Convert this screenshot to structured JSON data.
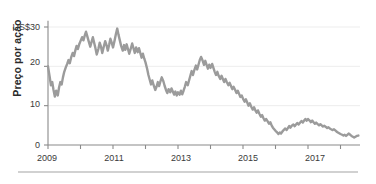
{
  "figure": {
    "partial_caption_above": "",
    "divider_color": "#999999",
    "background": "#ffffff"
  },
  "chart_data": {
    "type": "line",
    "title": "",
    "subtitle": "",
    "xlabel": "",
    "ylabel": "Preço por ação",
    "y_unit_prefix": "US$",
    "ylim": [
      0,
      33
    ],
    "xlim": [
      2009.0,
      2018.6
    ],
    "grid": "horizontal-faint",
    "legend": "none",
    "line_color": "#9b9b9b",
    "axis_color": "#8a8a8a",
    "gridline_color": "#ededed",
    "y_ticks": [
      {
        "value": 30,
        "label": "US$30"
      },
      {
        "value": 20,
        "label": "20"
      },
      {
        "value": 10,
        "label": "10"
      },
      {
        "value": 0,
        "label": "0"
      }
    ],
    "x_ticks_major": [
      {
        "value": 2009,
        "label": "2009"
      },
      {
        "value": 2011,
        "label": "2011"
      },
      {
        "value": 2013,
        "label": "2013"
      },
      {
        "value": 2015,
        "label": "2015"
      },
      {
        "value": 2017,
        "label": "2017"
      }
    ],
    "x_ticks_minor": [
      2010,
      2012,
      2014,
      2016,
      2018
    ],
    "series": [
      {
        "name": "Preço por ação",
        "color": "#9b9b9b",
        "x": [
          2009.0,
          2009.05,
          2009.09,
          2009.13,
          2009.17,
          2009.21,
          2009.25,
          2009.3,
          2009.34,
          2009.38,
          2009.42,
          2009.46,
          2009.5,
          2009.55,
          2009.59,
          2009.63,
          2009.67,
          2009.71,
          2009.76,
          2009.8,
          2009.84,
          2009.88,
          2009.92,
          2009.96,
          2010.0,
          2010.05,
          2010.09,
          2010.13,
          2010.17,
          2010.21,
          2010.25,
          2010.3,
          2010.34,
          2010.38,
          2010.42,
          2010.46,
          2010.5,
          2010.55,
          2010.59,
          2010.63,
          2010.67,
          2010.71,
          2010.76,
          2010.8,
          2010.84,
          2010.88,
          2010.92,
          2010.96,
          2011.0,
          2011.05,
          2011.09,
          2011.13,
          2011.17,
          2011.21,
          2011.25,
          2011.3,
          2011.34,
          2011.38,
          2011.42,
          2011.46,
          2011.5,
          2011.55,
          2011.59,
          2011.63,
          2011.67,
          2011.71,
          2011.76,
          2011.8,
          2011.84,
          2011.88,
          2011.92,
          2011.96,
          2012.0,
          2012.05,
          2012.09,
          2012.13,
          2012.17,
          2012.21,
          2012.25,
          2012.3,
          2012.34,
          2012.38,
          2012.42,
          2012.46,
          2012.5,
          2012.55,
          2012.59,
          2012.63,
          2012.67,
          2012.71,
          2012.76,
          2012.8,
          2012.84,
          2012.88,
          2012.92,
          2012.96,
          2013.0,
          2013.05,
          2013.09,
          2013.13,
          2013.17,
          2013.21,
          2013.25,
          2013.3,
          2013.34,
          2013.38,
          2013.42,
          2013.46,
          2013.5,
          2013.55,
          2013.59,
          2013.63,
          2013.67,
          2013.71,
          2013.76,
          2013.8,
          2013.84,
          2013.88,
          2013.92,
          2013.96,
          2014.0,
          2014.05,
          2014.09,
          2014.13,
          2014.17,
          2014.21,
          2014.25,
          2014.3,
          2014.34,
          2014.38,
          2014.42,
          2014.46,
          2014.5,
          2014.55,
          2014.59,
          2014.63,
          2014.67,
          2014.71,
          2014.76,
          2014.8,
          2014.84,
          2014.88,
          2014.92,
          2014.96,
          2015.0,
          2015.05,
          2015.09,
          2015.13,
          2015.17,
          2015.21,
          2015.25,
          2015.3,
          2015.34,
          2015.38,
          2015.42,
          2015.46,
          2015.5,
          2015.55,
          2015.59,
          2015.63,
          2015.67,
          2015.71,
          2015.76,
          2015.8,
          2015.84,
          2015.88,
          2015.92,
          2015.96,
          2016.0,
          2016.05,
          2016.09,
          2016.13,
          2016.17,
          2016.21,
          2016.25,
          2016.3,
          2016.34,
          2016.38,
          2016.42,
          2016.46,
          2016.5,
          2016.55,
          2016.59,
          2016.63,
          2016.67,
          2016.71,
          2016.76,
          2016.8,
          2016.84,
          2016.88,
          2016.92,
          2016.96,
          2017.0,
          2017.05,
          2017.09,
          2017.13,
          2017.17,
          2017.21,
          2017.25,
          2017.3,
          2017.34,
          2017.38,
          2017.42,
          2017.46,
          2017.5,
          2017.55,
          2017.59,
          2017.63,
          2017.67,
          2017.71,
          2017.76,
          2017.8,
          2017.84,
          2017.88,
          2017.92,
          2017.96,
          2018.0,
          2018.05,
          2018.09,
          2018.13,
          2018.17,
          2018.21,
          2018.25,
          2018.3,
          2018.34,
          2018.38,
          2018.42,
          2018.46,
          2018.5,
          2018.55
        ],
        "y": [
          20.0,
          17.4,
          15.2,
          16.0,
          14.0,
          12.3,
          13.8,
          12.6,
          14.6,
          16.0,
          15.4,
          17.2,
          18.6,
          19.8,
          20.6,
          21.6,
          20.8,
          22.2,
          23.4,
          22.6,
          24.0,
          25.2,
          24.4,
          25.6,
          26.4,
          27.4,
          26.6,
          27.8,
          28.8,
          27.6,
          26.4,
          25.0,
          26.2,
          27.4,
          26.0,
          24.6,
          23.0,
          24.4,
          26.0,
          25.0,
          23.4,
          24.8,
          26.4,
          25.4,
          24.0,
          25.4,
          27.0,
          26.0,
          24.8,
          26.6,
          28.2,
          29.6,
          28.0,
          26.6,
          25.2,
          24.0,
          25.4,
          24.2,
          25.6,
          24.4,
          23.2,
          24.6,
          25.8,
          24.6,
          23.4,
          24.8,
          23.6,
          24.6,
          23.4,
          22.2,
          23.2,
          22.0,
          21.0,
          19.4,
          17.8,
          16.6,
          15.4,
          16.4,
          15.2,
          14.0,
          14.8,
          16.0,
          15.0,
          16.2,
          17.2,
          16.2,
          15.0,
          14.0,
          13.2,
          14.2,
          13.4,
          14.4,
          13.6,
          12.8,
          13.6,
          12.6,
          13.4,
          12.8,
          13.8,
          12.9,
          13.8,
          14.8,
          16.0,
          15.2,
          16.4,
          17.6,
          18.8,
          17.8,
          19.0,
          20.2,
          19.2,
          20.4,
          21.6,
          22.4,
          21.4,
          20.4,
          21.4,
          20.4,
          19.4,
          20.4,
          19.6,
          20.6,
          19.6,
          18.6,
          17.8,
          18.6,
          17.6,
          16.8,
          17.6,
          16.8,
          16.0,
          16.8,
          16.0,
          15.2,
          15.8,
          15.0,
          14.2,
          14.8,
          14.0,
          13.2,
          13.8,
          13.0,
          12.2,
          12.6,
          11.8,
          11.0,
          11.6,
          10.8,
          10.0,
          10.6,
          9.8,
          9.0,
          9.6,
          8.8,
          8.2,
          8.8,
          8.0,
          7.2,
          7.6,
          6.8,
          6.2,
          6.6,
          6.0,
          5.4,
          5.8,
          5.0,
          4.4,
          4.0,
          3.6,
          3.2,
          2.8,
          3.2,
          2.9,
          3.4,
          3.8,
          4.2,
          3.8,
          4.3,
          4.8,
          4.4,
          4.9,
          5.2,
          4.8,
          5.2,
          5.6,
          5.2,
          5.7,
          6.1,
          5.7,
          6.2,
          6.6,
          6.2,
          6.6,
          6.2,
          5.8,
          6.2,
          5.8,
          5.4,
          5.7,
          5.3,
          5.0,
          5.3,
          5.0,
          4.7,
          4.9,
          4.6,
          4.3,
          4.5,
          4.2,
          4.0,
          3.8,
          4.0,
          3.7,
          3.4,
          3.2,
          3.0,
          2.8,
          2.6,
          2.4,
          2.6,
          2.3,
          2.6,
          2.9,
          2.6,
          2.3,
          2.1,
          1.9,
          2.1,
          2.3,
          2.4
        ]
      }
    ]
  }
}
